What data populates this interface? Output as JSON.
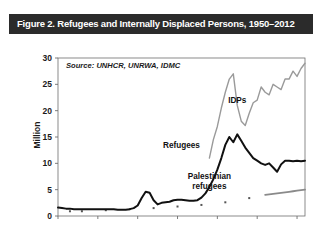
{
  "figure": {
    "title": "Figure 2. Refugees and Internally Displaced Persons, 1950–2012",
    "source_note": "Source: UNHCR, UNRWA, IDMC",
    "title_bar_color": "#2b2b2b",
    "background_color": "#ffffff"
  },
  "chart_data": {
    "type": "line",
    "title": "Figure 2. Refugees and Internally Displaced Persons, 1950–2012",
    "subtitle": "Source: UNHCR, UNRWA, IDMC",
    "xlabel": "",
    "ylabel": "Million",
    "xlim": [
      1950,
      2012
    ],
    "ylim": [
      0,
      30
    ],
    "xticks": [
      1950,
      1960,
      1970,
      1980,
      1990,
      2000,
      2010
    ],
    "yticks": [
      0,
      5,
      10,
      15,
      20,
      25,
      30
    ],
    "grid": false,
    "legend": "inline-annotations",
    "series": [
      {
        "name": "Refugees",
        "color": "#111111",
        "label_x": 1981,
        "label_y": 13.0,
        "x": [
          1950,
          1951,
          1952,
          1953,
          1954,
          1955,
          1956,
          1957,
          1958,
          1959,
          1960,
          1961,
          1962,
          1963,
          1964,
          1965,
          1966,
          1967,
          1968,
          1969,
          1970,
          1971,
          1972,
          1973,
          1974,
          1975,
          1976,
          1977,
          1978,
          1979,
          1980,
          1981,
          1982,
          1983,
          1984,
          1985,
          1986,
          1987,
          1988,
          1989,
          1990,
          1991,
          1992,
          1993,
          1994,
          1995,
          1996,
          1997,
          1998,
          1999,
          2000,
          2001,
          2002,
          2003,
          2004,
          2005,
          2006,
          2007,
          2008,
          2009,
          2010,
          2011,
          2012
        ],
        "y": [
          1.6,
          1.5,
          1.4,
          1.4,
          1.3,
          1.3,
          1.3,
          1.3,
          1.3,
          1.3,
          1.3,
          1.3,
          1.3,
          1.3,
          1.3,
          1.2,
          1.2,
          1.2,
          1.3,
          1.5,
          2.0,
          3.4,
          4.6,
          4.4,
          3.0,
          2.2,
          2.5,
          2.6,
          2.7,
          3.0,
          3.1,
          3.1,
          3.0,
          2.9,
          2.9,
          3.0,
          3.5,
          4.3,
          5.5,
          7.0,
          8.8,
          11.0,
          13.5,
          15.0,
          14.0,
          15.5,
          14.3,
          13.0,
          12.0,
          11.0,
          10.5,
          10.0,
          9.7,
          10.0,
          9.2,
          8.4,
          9.8,
          10.5,
          10.5,
          10.4,
          10.5,
          10.4,
          10.5
        ]
      },
      {
        "name": "IDPs",
        "color": "#9a9a9a",
        "label_x": 1995,
        "label_y": 21.5,
        "x": [
          1988,
          1989,
          1990,
          1991,
          1992,
          1993,
          1994,
          1995,
          1996,
          1997,
          1998,
          1999,
          2000,
          2001,
          2002,
          2003,
          2004,
          2005,
          2006,
          2007,
          2008,
          2009,
          2010,
          2011,
          2012
        ],
        "y": [
          11.0,
          14.5,
          17.0,
          20.5,
          23.5,
          26.0,
          27.0,
          21.0,
          18.0,
          17.2,
          19.5,
          21.5,
          22.0,
          24.5,
          23.5,
          23.0,
          25.0,
          24.5,
          24.0,
          26.0,
          26.0,
          27.5,
          26.5,
          28.0,
          29.0
        ]
      },
      {
        "name": "Palestinian refugees",
        "color": "#8a8a8a",
        "label_x": 1988,
        "label_y": 7.0,
        "x": [
          2002,
          2003,
          2004,
          2005,
          2006,
          2007,
          2008,
          2009,
          2010,
          2011,
          2012
        ],
        "y": [
          4.0,
          4.1,
          4.2,
          4.3,
          4.4,
          4.5,
          4.6,
          4.7,
          4.8,
          4.9,
          5.0
        ]
      }
    ],
    "marker_dots": {
      "name": "palestinian-data-dots",
      "color": "#555555",
      "x": [
        1953,
        1956,
        1962,
        1968,
        1974,
        1980,
        1986,
        1992,
        1998
      ],
      "y": [
        0.9,
        0.9,
        1.1,
        1.3,
        1.5,
        1.8,
        2.1,
        2.6,
        3.4
      ]
    }
  }
}
